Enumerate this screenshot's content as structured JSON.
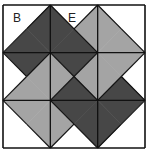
{
  "diagram": {
    "grid": {
      "rows": 3,
      "cols": 3
    },
    "colors": {
      "dark": "#474747",
      "light": "#a4a4a4",
      "white": "#ffffff",
      "line": "#111111"
    },
    "labels": [
      {
        "id": "B",
        "text": "B",
        "cell": [
          0,
          0
        ],
        "position": "upper-left"
      },
      {
        "id": "E",
        "text": "E",
        "cell": [
          0,
          1
        ],
        "position": "top"
      }
    ],
    "cells": [
      {
        "row": 0,
        "col": 0,
        "top": "white",
        "right": "dark",
        "bottom": "dark",
        "left": "white"
      },
      {
        "row": 0,
        "col": 1,
        "top": "white",
        "right": "light",
        "bottom": "dark",
        "left": "dark"
      },
      {
        "row": 0,
        "col": 2,
        "top": "white",
        "right": "white",
        "bottom": "light",
        "left": "light"
      },
      {
        "row": 1,
        "col": 0,
        "top": "dark",
        "right": "light",
        "bottom": "light",
        "left": "white"
      },
      {
        "row": 1,
        "col": 1,
        "top": "dark",
        "right": "light",
        "bottom": "dark",
        "left": "light"
      },
      {
        "row": 1,
        "col": 2,
        "top": "light",
        "right": "white",
        "bottom": "dark",
        "left": "light"
      },
      {
        "row": 2,
        "col": 0,
        "top": "light",
        "right": "light",
        "bottom": "white",
        "left": "white"
      },
      {
        "row": 2,
        "col": 1,
        "top": "dark",
        "right": "dark",
        "bottom": "white",
        "left": "light"
      },
      {
        "row": 2,
        "col": 2,
        "top": "dark",
        "right": "white",
        "bottom": "white",
        "left": "dark"
      }
    ]
  }
}
